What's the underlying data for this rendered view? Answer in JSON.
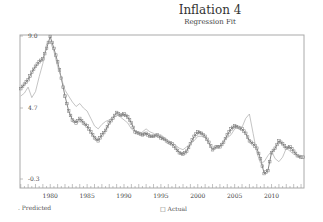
{
  "header": {
    "title": "Inflation 4",
    "subtitle": "Regression Fit"
  },
  "legend": {
    "predicted_label": "Predicted",
    "actual_label": "Actual"
  },
  "colors": {
    "frame": "#aaaaaa",
    "actual": "#777777",
    "predicted": "#aaaaaa",
    "text": "#444444"
  },
  "chart_data": {
    "type": "line",
    "title": "Inflation 4",
    "subtitle": "Regression Fit",
    "xlabel": "",
    "ylabel": "",
    "xlim": [
      1975.9,
      2014.4
    ],
    "ylim": [
      -0.3,
      9.0
    ],
    "grid": false,
    "legend_position": "bottom",
    "x_ticks": [
      1980,
      1985,
      1990,
      1995,
      2000,
      2005,
      2010
    ],
    "y_ticks": [
      9.0,
      4.7,
      -0.3
    ],
    "y_tick_labels": [
      "9.0",
      "4.7",
      "-0.3"
    ],
    "series": [
      {
        "name": "Actual",
        "marker": "square",
        "x": [
          1976.0,
          1976.5,
          1977.0,
          1977.5,
          1978.0,
          1978.5,
          1979.0,
          1979.5,
          1980.0,
          1980.5,
          1981.0,
          1981.5,
          1982.0,
          1982.5,
          1983.0,
          1983.5,
          1984.0,
          1984.5,
          1985.0,
          1985.5,
          1986.0,
          1986.5,
          1987.0,
          1987.5,
          1988.0,
          1988.5,
          1989.0,
          1989.5,
          1990.0,
          1990.5,
          1991.0,
          1991.5,
          1992.0,
          1992.5,
          1993.0,
          1993.5,
          1994.0,
          1994.5,
          1995.0,
          1995.5,
          1996.0,
          1996.5,
          1997.0,
          1997.5,
          1998.0,
          1998.5,
          1999.0,
          1999.5,
          2000.0,
          2000.5,
          2001.0,
          2001.5,
          2002.0,
          2002.5,
          2003.0,
          2003.5,
          2004.0,
          2004.5,
          2005.0,
          2005.5,
          2006.0,
          2006.5,
          2007.0,
          2007.5,
          2008.0,
          2008.5,
          2009.0,
          2009.5,
          2010.0,
          2010.5,
          2011.0,
          2011.5,
          2012.0,
          2012.5,
          2013.0,
          2013.5,
          2014.0
        ],
        "values": [
          5.5,
          5.8,
          6.1,
          6.6,
          7.0,
          7.3,
          7.5,
          8.2,
          9.0,
          8.2,
          7.3,
          6.2,
          5.0,
          4.0,
          3.4,
          3.2,
          3.5,
          3.2,
          3.0,
          2.6,
          2.2,
          2.0,
          2.4,
          2.7,
          3.2,
          3.5,
          3.9,
          3.7,
          3.8,
          3.6,
          3.2,
          2.6,
          2.5,
          2.4,
          2.5,
          2.3,
          2.3,
          2.4,
          2.2,
          2.1,
          1.9,
          1.8,
          1.5,
          1.2,
          1.1,
          1.3,
          1.8,
          2.3,
          2.6,
          2.5,
          2.3,
          1.9,
          1.4,
          1.6,
          1.6,
          1.9,
          2.4,
          2.8,
          3.0,
          2.9,
          2.8,
          2.5,
          2.0,
          1.8,
          1.5,
          0.8,
          -0.2,
          0.0,
          1.2,
          1.5,
          2.0,
          1.8,
          1.5,
          1.6,
          1.3,
          1.0,
          0.9
        ]
      },
      {
        "name": "Predicted",
        "marker": "none",
        "x": [
          1976.0,
          1976.5,
          1977.0,
          1977.5,
          1978.0,
          1978.5,
          1979.0,
          1979.5,
          1980.0,
          1980.5,
          1981.0,
          1981.5,
          1982.0,
          1982.5,
          1983.0,
          1983.5,
          1984.0,
          1984.5,
          1985.0,
          1985.5,
          1986.0,
          1986.5,
          1987.0,
          1987.5,
          1988.0,
          1988.5,
          1989.0,
          1989.5,
          1990.0,
          1990.5,
          1991.0,
          1991.5,
          1992.0,
          1992.5,
          1993.0,
          1993.5,
          1994.0,
          1994.5,
          1995.0,
          1995.5,
          1996.0,
          1996.5,
          1997.0,
          1997.5,
          1998.0,
          1998.5,
          1999.0,
          1999.5,
          2000.0,
          2000.5,
          2001.0,
          2001.5,
          2002.0,
          2002.5,
          2003.0,
          2003.5,
          2004.0,
          2004.5,
          2005.0,
          2005.5,
          2006.0,
          2006.5,
          2007.0,
          2007.5,
          2008.0,
          2008.5,
          2009.0,
          2009.5,
          2010.0,
          2010.5,
          2011.0,
          2011.5,
          2012.0,
          2012.5,
          2013.0,
          2013.5,
          2014.0
        ],
        "values": [
          5.0,
          5.2,
          5.6,
          4.9,
          5.3,
          6.3,
          7.2,
          8.5,
          8.7,
          8.0,
          7.0,
          6.2,
          5.4,
          5.0,
          4.6,
          4.3,
          4.5,
          4.2,
          4.0,
          3.5,
          3.0,
          2.8,
          3.1,
          3.3,
          3.4,
          3.6,
          3.9,
          3.6,
          3.4,
          3.2,
          2.8,
          2.6,
          2.4,
          2.6,
          2.8,
          2.6,
          2.5,
          2.3,
          2.4,
          2.2,
          2.0,
          1.9,
          1.7,
          1.5,
          1.4,
          1.6,
          1.8,
          2.0,
          2.3,
          2.3,
          2.2,
          1.8,
          1.4,
          1.5,
          1.7,
          2.0,
          2.2,
          2.4,
          2.8,
          2.9,
          2.9,
          3.5,
          3.8,
          2.5,
          1.2,
          0.5,
          0.6,
          1.0,
          1.3,
          0.8,
          0.6,
          0.9,
          1.5,
          1.3,
          1.1,
          1.0,
          1.0
        ]
      }
    ]
  }
}
